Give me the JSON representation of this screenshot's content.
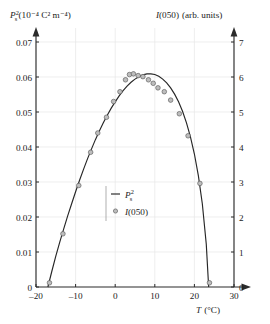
{
  "chart_data": {
    "type": "scatter",
    "title": "",
    "subtitle": "",
    "xlabel": "T (°C)",
    "ylabel_left": "P²s (10⁻⁴ C² m⁻⁴)",
    "ylabel_right": "I(050) (arb. units)",
    "xlim": [
      -20,
      30
    ],
    "ylim_left": [
      0,
      0.07
    ],
    "ylim_right": [
      0,
      7
    ],
    "xticks": [
      -20,
      -10,
      0,
      10,
      20,
      30
    ],
    "xtick_labels": [
      "–20",
      "–10",
      "0",
      "10",
      "20",
      "30"
    ],
    "yticks_left": [
      0,
      0.01,
      0.02,
      0.03,
      0.04,
      0.05,
      0.06,
      0.07
    ],
    "ytick_labels_left": [
      "0",
      "0.01",
      "0.02",
      "0.03",
      "0.04",
      "0.05",
      "0.06",
      "0.07"
    ],
    "yticks_right": [
      0,
      1,
      2,
      3,
      4,
      5,
      6,
      7
    ],
    "ytick_labels_right": [
      "0",
      "1",
      "2",
      "3",
      "4",
      "5",
      "6",
      "7"
    ],
    "grid": true,
    "legend_position": "center",
    "legend": [
      {
        "label": "P²s",
        "marker": "line"
      },
      {
        "label": "I(050)",
        "marker": "circle"
      }
    ],
    "series": [
      {
        "name": "P²s",
        "marker": "line",
        "x": [
          -17.0,
          -16.0,
          -15.0,
          -14.0,
          -13.0,
          -12.0,
          -11.0,
          -10.0,
          -9.0,
          -8.0,
          -7.0,
          -6.0,
          -5.0,
          -4.0,
          -3.0,
          -2.0,
          -1.0,
          0.0,
          1.0,
          2.0,
          3.0,
          4.0,
          5.0,
          6.0,
          7.0,
          8.0,
          9.0,
          10.0,
          11.0,
          12.0,
          13.0,
          14.0,
          15.0,
          16.0,
          17.0,
          18.0,
          19.0,
          20.0,
          21.0,
          22.0,
          23.0,
          23.6
        ],
        "y": [
          0.0,
          0.0045,
          0.0088,
          0.0128,
          0.0166,
          0.0203,
          0.0238,
          0.0272,
          0.0305,
          0.0336,
          0.0366,
          0.0394,
          0.0421,
          0.0446,
          0.0469,
          0.0491,
          0.0511,
          0.0529,
          0.0546,
          0.0561,
          0.0574,
          0.0585,
          0.0594,
          0.0601,
          0.0606,
          0.0609,
          0.0609,
          0.0607,
          0.0602,
          0.0594,
          0.0583,
          0.0569,
          0.0551,
          0.0529,
          0.0502,
          0.0469,
          0.0429,
          0.038,
          0.0318,
          0.0238,
          0.0122,
          0.0
        ]
      },
      {
        "name": "I(050)",
        "marker": "circle",
        "x": [
          -16.6,
          -13.2,
          -9.2,
          -6.2,
          -4.4,
          -2.2,
          -0.4,
          1.2,
          2.6,
          3.6,
          4.6,
          5.8,
          7.0,
          8.4,
          9.6,
          10.8,
          12.4,
          14.0,
          16.2,
          18.4,
          21.4,
          23.8
        ],
        "y": [
          0.0012,
          0.0152,
          0.029,
          0.0385,
          0.044,
          0.0485,
          0.053,
          0.0558,
          0.0592,
          0.0607,
          0.0609,
          0.0604,
          0.0601,
          0.0592,
          0.0582,
          0.0569,
          0.0558,
          0.0534,
          0.0495,
          0.0432,
          0.0296,
          0.0012
        ]
      }
    ]
  },
  "axes": {
    "left_title": {
      "symbol": "P",
      "sub": "s",
      "sup": "2",
      "units": "(10⁻⁴ C² m⁻⁴)"
    },
    "right_title": {
      "symbol": "I",
      "arg": "(050)",
      "units": "(arb. units)"
    },
    "x_title": {
      "symbol": "T",
      "units": "(°C)"
    }
  },
  "legend": {
    "entry_line_label_symbol": "P",
    "entry_line_label_sub": "s",
    "entry_line_label_sup": "2",
    "entry_marker_label_symbol": "I",
    "entry_marker_label_arg": "(050)"
  }
}
